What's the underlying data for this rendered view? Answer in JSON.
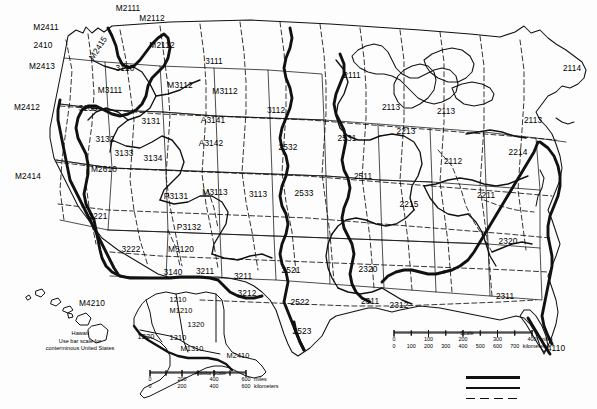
{
  "map": {
    "title": "Ecoregions of the United States",
    "background_color": "#ffffff",
    "line_color": "#111111",
    "provinces": [
      {
        "code": "M2411",
        "x": 46,
        "y": 27
      },
      {
        "code": "M2111",
        "x": 128,
        "y": 8
      },
      {
        "code": "M2112",
        "x": 152,
        "y": 18
      },
      {
        "code": "2410",
        "x": 43,
        "y": 45
      },
      {
        "code": "M2415",
        "x": 98,
        "y": 48,
        "rotated": true
      },
      {
        "code": "M2112",
        "x": 162,
        "y": 45
      },
      {
        "code": "M2413",
        "x": 42,
        "y": 66
      },
      {
        "code": "3120",
        "x": 125,
        "y": 68
      },
      {
        "code": "3111",
        "x": 214,
        "y": 61
      },
      {
        "code": "2111",
        "x": 352,
        "y": 75
      },
      {
        "code": "2114",
        "x": 572,
        "y": 68
      },
      {
        "code": "M3112",
        "x": 180,
        "y": 85
      },
      {
        "code": "M3111",
        "x": 110,
        "y": 90
      },
      {
        "code": "M3112",
        "x": 225,
        "y": 91
      },
      {
        "code": "M2412",
        "x": 27,
        "y": 107
      },
      {
        "code": "3135",
        "x": 88,
        "y": 108
      },
      {
        "code": "2113",
        "x": 391,
        "y": 107
      },
      {
        "code": "2113",
        "x": 446,
        "y": 111
      },
      {
        "code": "2113",
        "x": 533,
        "y": 120
      },
      {
        "code": "3112",
        "x": 276,
        "y": 110
      },
      {
        "code": "3131",
        "x": 151,
        "y": 121
      },
      {
        "code": "A3141",
        "x": 213,
        "y": 120
      },
      {
        "code": "2213",
        "x": 406,
        "y": 131
      },
      {
        "code": "3132",
        "x": 105,
        "y": 139
      },
      {
        "code": "A3142",
        "x": 211,
        "y": 143
      },
      {
        "code": "2531",
        "x": 347,
        "y": 138
      },
      {
        "code": "2532",
        "x": 288,
        "y": 147
      },
      {
        "code": "3133",
        "x": 124,
        "y": 153
      },
      {
        "code": "3134",
        "x": 153,
        "y": 158
      },
      {
        "code": "M2414",
        "x": 28,
        "y": 176
      },
      {
        "code": "M2610",
        "x": 104,
        "y": 169
      },
      {
        "code": "2214",
        "x": 518,
        "y": 152
      },
      {
        "code": "2112",
        "x": 453,
        "y": 161
      },
      {
        "code": "2511",
        "x": 363,
        "y": 176
      },
      {
        "code": "M3113",
        "x": 215,
        "y": 192
      },
      {
        "code": "3113",
        "x": 258,
        "y": 194
      },
      {
        "code": "2533",
        "x": 304,
        "y": 193
      },
      {
        "code": "P3131",
        "x": 176,
        "y": 196
      },
      {
        "code": "2215",
        "x": 409,
        "y": 204
      },
      {
        "code": "2211",
        "x": 486,
        "y": 195
      },
      {
        "code": "3221",
        "x": 98,
        "y": 216
      },
      {
        "code": "P3132",
        "x": 189,
        "y": 227
      },
      {
        "code": "3222",
        "x": 131,
        "y": 249
      },
      {
        "code": "M3120",
        "x": 181,
        "y": 249
      },
      {
        "code": "2320",
        "x": 508,
        "y": 241
      },
      {
        "code": "3140",
        "x": 173,
        "y": 272
      },
      {
        "code": "3211",
        "x": 205,
        "y": 271
      },
      {
        "code": "3211",
        "x": 243,
        "y": 276
      },
      {
        "code": "2521",
        "x": 291,
        "y": 270
      },
      {
        "code": "2320",
        "x": 368,
        "y": 269
      },
      {
        "code": "3212",
        "x": 247,
        "y": 293
      },
      {
        "code": "2522",
        "x": 300,
        "y": 302
      },
      {
        "code": "2311",
        "x": 370,
        "y": 301
      },
      {
        "code": "2312",
        "x": 399,
        "y": 305
      },
      {
        "code": "2311",
        "x": 505,
        "y": 296
      },
      {
        "code": "2523",
        "x": 302,
        "y": 331
      },
      {
        "code": "4110",
        "x": 556,
        "y": 348
      }
    ],
    "hawaii_inset": {
      "label": "M4210",
      "label_x": 92,
      "label_y": 303,
      "caption_line1": "Hawaii",
      "caption_line2": "Use bar scale for",
      "caption_line3": "conterminous United States",
      "caption_x": 80,
      "caption_y": 330
    },
    "alaska_inset": {
      "provinces": [
        {
          "code": "1210",
          "x": 178,
          "y": 300
        },
        {
          "code": "M1210",
          "x": 181,
          "y": 311
        },
        {
          "code": "1320",
          "x": 196,
          "y": 325
        },
        {
          "code": "1220",
          "x": 146,
          "y": 337
        },
        {
          "code": "1310",
          "x": 178,
          "y": 338
        },
        {
          "code": "M1310",
          "x": 192,
          "y": 349
        },
        {
          "code": "M2410",
          "x": 238,
          "y": 356
        }
      ],
      "scale": {
        "title": "Alaska  Scale",
        "title_x": 207,
        "title_y": 374,
        "miles_ticks": [
          "0",
          "200",
          "400",
          "600"
        ],
        "miles_unit": "miles",
        "km_ticks": [
          "0",
          "200",
          "400",
          "600"
        ],
        "km_unit": "kilometers"
      }
    },
    "main_scale": {
      "title": "Scale",
      "title_x": 435,
      "title_y": 334,
      "miles_ticks": [
        "0",
        "100",
        "200",
        "300",
        "400"
      ],
      "miles_unit": "miles",
      "km_ticks": [
        "0",
        "100",
        "200",
        "300",
        "400",
        "500",
        "600",
        "700"
      ],
      "km_unit": "kilometers"
    },
    "legend": {
      "x": 466,
      "y": 376,
      "lines": [
        {
          "name": "domain-boundary",
          "style": "thick-solid",
          "thickness": 3.0
        },
        {
          "name": "division-boundary",
          "style": "medium-solid",
          "thickness": 1.6
        },
        {
          "name": "province-boundary",
          "style": "dashed",
          "thickness": 1.2
        }
      ]
    }
  }
}
